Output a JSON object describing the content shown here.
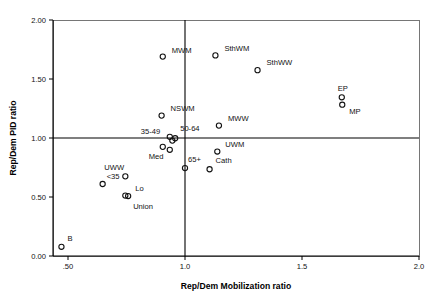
{
  "chart_data": {
    "type": "scatter",
    "title": "",
    "xlabel": "Rep/Dem Mobilization ratio",
    "ylabel": "Rep/Dem PID ratio",
    "xlim": [
      0.45,
      2.0
    ],
    "ylim": [
      0.0,
      2.0
    ],
    "xticks": [
      0.5,
      1.0,
      1.5,
      2.0
    ],
    "xticklabels": [
      ".50",
      "1.0",
      "1.5",
      "2.0"
    ],
    "yticks": [
      0.0,
      0.5,
      1.0,
      1.5,
      2.0
    ],
    "yticklabels": [
      "0.00",
      "0.50",
      "1.00",
      "1.50",
      "2.00"
    ],
    "grid": false,
    "legend": false,
    "reference_lines": {
      "vertical_x": 1.0,
      "horizontal_y": 1.0
    },
    "marker": "open-circle",
    "points": [
      {
        "label": "MWM",
        "x": 0.905,
        "y": 1.69,
        "label_dx": 9,
        "label_dy": -4
      },
      {
        "label": "SthWM",
        "x": 1.13,
        "y": 1.7,
        "label_dx": 9,
        "label_dy": -4
      },
      {
        "label": "SthWW",
        "x": 1.31,
        "y": 1.575,
        "label_dx": 9,
        "label_dy": -5
      },
      {
        "label": "EP",
        "x": 1.67,
        "y": 1.345,
        "label_dx": -4,
        "label_dy": -6
      },
      {
        "label": "MP",
        "x": 1.672,
        "y": 1.282,
        "label_dx": 7,
        "label_dy": 9
      },
      {
        "label": "NSWM",
        "x": 0.9,
        "y": 1.19,
        "label_dx": 9,
        "label_dy": -5
      },
      {
        "label": "MWW",
        "x": 1.145,
        "y": 1.105,
        "label_dx": 9,
        "label_dy": -5
      },
      {
        "label": "35-49",
        "x": 0.935,
        "y": 1.01,
        "label_dx": -29,
        "label_dy": -3
      },
      {
        "label": "50-64",
        "x": 0.958,
        "y": 0.998,
        "label_dx": 5,
        "label_dy": -7
      },
      {
        "label": "",
        "x": 0.946,
        "y": 0.978,
        "label_dx": 0,
        "label_dy": 0
      },
      {
        "label": "Med",
        "x": 0.905,
        "y": 0.925,
        "label_dx": -14,
        "label_dy": 12
      },
      {
        "label": "",
        "x": 0.935,
        "y": 0.9,
        "label_dx": 0,
        "label_dy": 0
      },
      {
        "label": "UWM",
        "x": 1.138,
        "y": 0.885,
        "label_dx": 8,
        "label_dy": -5
      },
      {
        "label": "Cath",
        "x": 1.105,
        "y": 0.735,
        "label_dx": 6,
        "label_dy": -6
      },
      {
        "label": "65+",
        "x": 1.0,
        "y": 0.745,
        "label_dx": 3,
        "label_dy": -6
      },
      {
        "label": "UWW",
        "x": 0.745,
        "y": 0.675,
        "label_dx": -21,
        "label_dy": -6
      },
      {
        "label": "<35",
        "x": 0.648,
        "y": 0.61,
        "label_dx": 4,
        "label_dy": -5
      },
      {
        "label": "Lo",
        "x": 0.745,
        "y": 0.512,
        "label_dx": 10,
        "label_dy": -5
      },
      {
        "label": "Union",
        "x": 0.757,
        "y": 0.508,
        "label_dx": 5,
        "label_dy": 13
      },
      {
        "label": "B",
        "x": 0.472,
        "y": 0.078,
        "label_dx": 6,
        "label_dy": -6
      }
    ]
  },
  "colors": {
    "marker_stroke": "#111111",
    "axis": "#000000",
    "frame": "#555555",
    "background": "#ffffff"
  }
}
